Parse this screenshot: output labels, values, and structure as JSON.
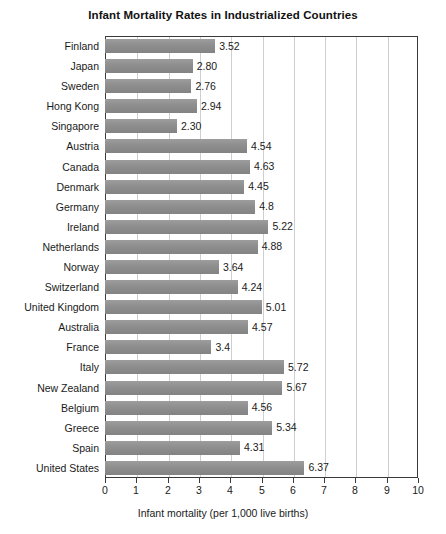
{
  "chart_data": {
    "type": "bar",
    "orientation": "horizontal",
    "title": "Infant Mortality Rates in Industrialized Countries",
    "xlabel": "Infant mortality (per 1,000 live births)",
    "ylabel": "",
    "xlim": [
      0,
      10
    ],
    "xticks": [
      "0",
      "1",
      "2",
      "3",
      "4",
      "5",
      "6",
      "7",
      "8",
      "9",
      "10"
    ],
    "grid": "vertical",
    "legend": "none",
    "bar_color": "#8e8e8e",
    "categories": [
      "Finland",
      "Japan",
      "Sweden",
      "Hong Kong",
      "Singapore",
      "Austria",
      "Canada",
      "Denmark",
      "Germany",
      "Ireland",
      "Netherlands",
      "Norway",
      "Switzerland",
      "United Kingdom",
      "Australia",
      "France",
      "Italy",
      "New Zealand",
      "Belgium",
      "Greece",
      "Spain",
      "United States"
    ],
    "values": [
      3.52,
      2.8,
      2.76,
      2.94,
      2.3,
      4.54,
      4.63,
      4.45,
      4.8,
      5.22,
      4.88,
      3.64,
      4.24,
      5.01,
      4.57,
      3.4,
      5.72,
      5.67,
      4.56,
      5.34,
      4.31,
      6.37
    ],
    "value_labels": [
      "3.52",
      "2.80",
      "2.76",
      "2.94",
      "2.30",
      "4.54",
      "4.63",
      "4.45",
      "4.8",
      "5.22",
      "4.88",
      "3.64",
      "4.24",
      "5.01",
      "4.57",
      "3.4",
      "5.72",
      "5.67",
      "4.56",
      "5.34",
      "4.31",
      "6.37"
    ]
  }
}
